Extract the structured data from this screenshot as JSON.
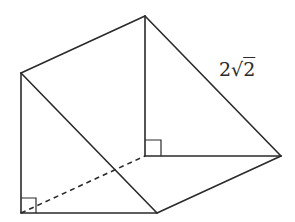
{
  "diagram": {
    "type": "triangular-prism",
    "stroke_color": "#2a2a2a",
    "background": "#ffffff",
    "vertices": {
      "A": {
        "x": 21,
        "y": 73
      },
      "B": {
        "x": 21,
        "y": 213
      },
      "C": {
        "x": 157,
        "y": 213
      },
      "A2": {
        "x": 145,
        "y": 16
      },
      "B2": {
        "x": 145,
        "y": 156
      },
      "C2": {
        "x": 281,
        "y": 156
      }
    },
    "edges": [
      {
        "from": "A",
        "to": "B",
        "style": "solid"
      },
      {
        "from": "B",
        "to": "C",
        "style": "solid"
      },
      {
        "from": "A",
        "to": "C",
        "style": "solid"
      },
      {
        "from": "A2",
        "to": "B2",
        "style": "solid"
      },
      {
        "from": "B2",
        "to": "C2",
        "style": "solid"
      },
      {
        "from": "A2",
        "to": "C2",
        "style": "solid"
      },
      {
        "from": "A",
        "to": "A2",
        "style": "solid"
      },
      {
        "from": "C",
        "to": "C2",
        "style": "solid"
      },
      {
        "from": "B",
        "to": "B2",
        "style": "dashed"
      }
    ],
    "right_angle_markers": [
      {
        "vertex": "B",
        "size": 15
      },
      {
        "vertex": "B2",
        "size": 16
      }
    ],
    "labels": [
      {
        "text_coef": "2",
        "text_radical": "√",
        "text_radicand": "2",
        "full": "2√2",
        "edge": "A2-C2"
      }
    ]
  }
}
